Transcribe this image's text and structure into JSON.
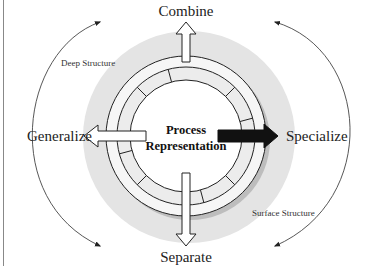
{
  "diagram": {
    "center_label_line1": "Process",
    "center_label_line2": "Representation",
    "arrows": {
      "top": "Combine",
      "bottom": "Separate",
      "left": "Generalize",
      "right": "Specialize"
    },
    "annotations": {
      "upper_left": "Deep Structure",
      "lower_right": "Surface Structure"
    },
    "colors": {
      "halo": "#e4e4e4",
      "ring_fill": "#f4f4f4",
      "ring_stroke": "#222222",
      "specialize_arrow": "#111111",
      "other_arrows": "#ffffff"
    }
  }
}
